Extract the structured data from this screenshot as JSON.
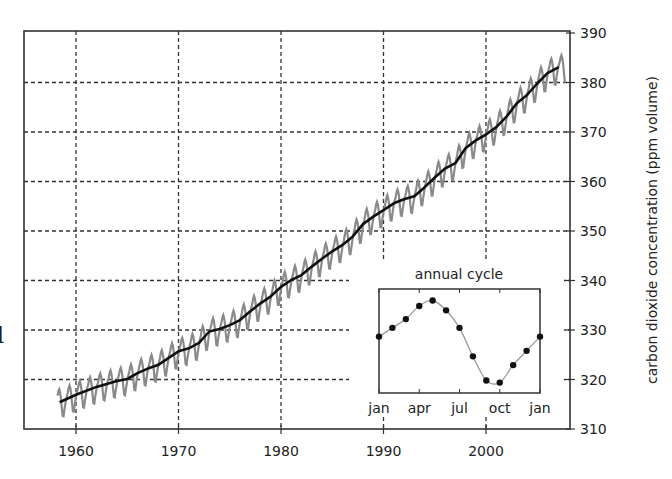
{
  "chart_data": [
    {
      "type": "line",
      "title": "",
      "xlabel": "",
      "ylabel": "carbon dioxide concentration (ppm volume)",
      "ylabel_side": "right",
      "xlim": [
        1955,
        2008.5
      ],
      "ylim": [
        310,
        390
      ],
      "xticks": [
        1960,
        1970,
        1980,
        1990,
        2000
      ],
      "yticks": [
        310,
        320,
        330,
        340,
        350,
        360,
        370,
        380,
        390
      ],
      "grid": true,
      "grid_style": "dashed",
      "series": [
        {
          "name": "monthly mean (seasonal)",
          "style": "gray zigzag",
          "color": "#8a8a8a",
          "seasonal_amplitude_ppm": 3.2
        },
        {
          "name": "annual trend",
          "style": "thick black smooth",
          "color": "#111111",
          "x": [
            1958.5,
            1960,
            1962,
            1964,
            1965,
            1966,
            1967,
            1968,
            1969,
            1970,
            1971,
            1972,
            1973,
            1974,
            1975,
            1976,
            1977,
            1978,
            1979,
            1980,
            1981,
            1982,
            1983,
            1984,
            1985,
            1986,
            1987,
            1988,
            1989,
            1990,
            1991,
            1992,
            1993,
            1994,
            1995,
            1996,
            1997,
            1998,
            1999,
            2000,
            2001,
            2002,
            2003,
            2004,
            2005,
            2006,
            2007
          ],
          "values": [
            315.5,
            316.9,
            318.5,
            319.7,
            320.1,
            321.3,
            322.2,
            322.9,
            324.3,
            325.7,
            326.3,
            327.4,
            329.7,
            330.2,
            331.0,
            332.0,
            333.8,
            335.4,
            336.8,
            338.7,
            340.1,
            341.1,
            342.8,
            344.4,
            345.9,
            347.2,
            348.9,
            351.4,
            352.9,
            354.2,
            355.6,
            356.4,
            357.0,
            358.8,
            360.8,
            362.6,
            363.7,
            366.7,
            368.3,
            369.5,
            371.0,
            373.1,
            375.8,
            377.5,
            379.8,
            381.9,
            383.0
          ]
        }
      ]
    },
    {
      "type": "line",
      "title": "annual cycle",
      "inset": true,
      "xlabel": "",
      "ylabel": "",
      "xticks": [
        "jan",
        "apr",
        "jul",
        "oct",
        "jan"
      ],
      "markers": true,
      "months": [
        "jan",
        "feb",
        "mar",
        "apr",
        "may",
        "jun",
        "jul",
        "aug",
        "sep",
        "oct",
        "nov",
        "dec",
        "jan"
      ],
      "values": [
        0.0,
        0.8,
        1.6,
        2.8,
        3.3,
        2.4,
        0.8,
        -1.8,
        -4.0,
        -4.2,
        -2.6,
        -1.3,
        0.0
      ],
      "units": "relative ppm (arbitrary, no y-axis labels shown)"
    }
  ],
  "axes": {
    "x_tick_labels": [
      "1960",
      "1970",
      "1980",
      "1990",
      "2000"
    ],
    "y_tick_labels": [
      "310",
      "320",
      "330",
      "340",
      "350",
      "360",
      "370",
      "380",
      "390"
    ],
    "y_title": "carbon dioxide concentration (ppm volume)"
  },
  "inset": {
    "title": "annual cycle",
    "tick_labels": [
      "jan",
      "apr",
      "jul",
      "oct",
      "jan"
    ]
  },
  "partial_left_glyph": "l",
  "colors": {
    "seasonal": "#8a8a8a",
    "trend": "#111111",
    "grid": "#333333",
    "frame": "#333333"
  }
}
